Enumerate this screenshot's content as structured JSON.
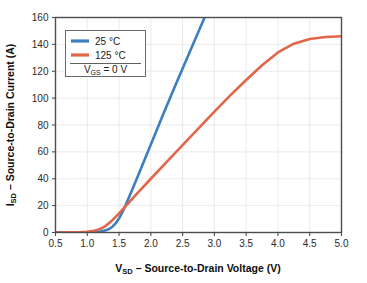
{
  "chart_data": {
    "type": "line",
    "title": "",
    "xlabel": "V_SD – Source-to-Drain Voltage (V)",
    "ylabel": "I_SD – Source-to-Drain Current (A)",
    "xlabel_parts": {
      "prefix": "V",
      "sub": "SD",
      "rest": " – Source-to-Drain Voltage (V)"
    },
    "ylabel_parts": {
      "prefix": "I",
      "sub": "SD",
      "rest": " – Source-to-Drain Current (A)"
    },
    "xlim": [
      0.5,
      5.0
    ],
    "ylim": [
      0,
      160
    ],
    "xticks": [
      0.5,
      1.0,
      1.5,
      2.0,
      2.5,
      3.0,
      3.5,
      4.0,
      4.5,
      5.0
    ],
    "xticklabels": [
      "0.5",
      "1.0",
      "1.5",
      "2.0",
      "2.5",
      "3.0",
      "3.5",
      "4.0",
      "4.5",
      "5.0"
    ],
    "yticks": [
      0,
      20,
      40,
      60,
      80,
      100,
      120,
      140,
      160
    ],
    "yticklabels": [
      "0",
      "20",
      "40",
      "60",
      "80",
      "100",
      "120",
      "140",
      "160"
    ],
    "grid": true,
    "legend_position": "upper left",
    "annotation": {
      "prefix": "V",
      "sub": "GS",
      "rest": " = 0 V",
      "text": "V_GS = 0 V"
    },
    "series": [
      {
        "name": "25 °C",
        "label_parts": {
          "value": "25",
          "unit": "°C"
        },
        "color": "#3b7fc0",
        "x": [
          0.5,
          0.7,
          0.9,
          1.0,
          1.1,
          1.2,
          1.25,
          1.3,
          1.35,
          1.4,
          1.45,
          1.5,
          1.55,
          1.6,
          1.65,
          1.7,
          1.8,
          1.9,
          2.0,
          2.2,
          2.4,
          2.6,
          2.8,
          3.0,
          3.2,
          3.35
        ],
        "y": [
          0.0,
          0.0,
          0.1,
          0.2,
          0.4,
          0.8,
          1.2,
          1.8,
          2.8,
          4.5,
          7.0,
          10.5,
          15.0,
          20.0,
          25.5,
          31.0,
          42.5,
          54.0,
          65.5,
          88.5,
          111.0,
          133.0,
          155.0,
          177.0,
          199.0,
          215.0
        ]
      },
      {
        "name": "125 °C",
        "label_parts": {
          "value": "125",
          "unit": "°C"
        },
        "color": "#e2664a",
        "x": [
          0.5,
          0.7,
          0.9,
          1.0,
          1.1,
          1.15,
          1.2,
          1.25,
          1.3,
          1.35,
          1.4,
          1.45,
          1.5,
          1.6,
          1.7,
          1.8,
          2.0,
          2.25,
          2.5,
          2.75,
          3.0,
          3.25,
          3.5,
          3.75,
          4.0,
          4.25,
          4.5,
          4.75,
          5.0
        ],
        "y": [
          0.0,
          0.1,
          0.3,
          0.6,
          1.2,
          1.8,
          2.6,
          3.8,
          5.3,
          7.2,
          9.4,
          11.8,
          14.3,
          19.5,
          24.7,
          29.8,
          40.0,
          52.5,
          65.0,
          77.5,
          90.0,
          102.0,
          113.5,
          124.5,
          134.0,
          140.5,
          144.0,
          145.5,
          146.0
        ]
      }
    ]
  },
  "legend": {
    "entries": [
      {
        "label": "25 °C"
      },
      {
        "label": "125 °C"
      }
    ],
    "note": "V_GS = 0 V"
  }
}
